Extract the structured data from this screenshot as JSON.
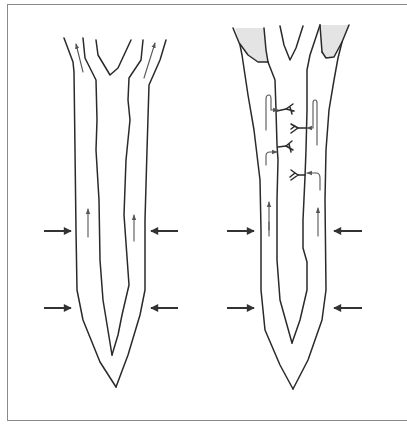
{
  "figure": {
    "panels": [
      {
        "id": "left-panel",
        "compression_arrows": 4,
        "flow_arrows": 4,
        "branch_connectors": 0,
        "shaded_regions": 0
      },
      {
        "id": "right-panel",
        "compression_arrows": 4,
        "flow_arrows": 6,
        "branch_connectors": 4,
        "shaded_regions": 2
      }
    ],
    "colors": {
      "line": "#2a2a2a",
      "arrow": "#333333",
      "shade": "#e4e4e4",
      "frame": "#8a8a8a",
      "background": "#ffffff"
    },
    "text_labels": []
  }
}
